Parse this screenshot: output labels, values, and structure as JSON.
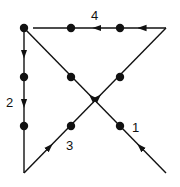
{
  "diagram": {
    "colors": {
      "stroke": "#111111",
      "background": "#ffffff"
    },
    "dots": [
      {
        "x": 24,
        "y": 28
      },
      {
        "x": 71,
        "y": 28
      },
      {
        "x": 120,
        "y": 28
      },
      {
        "x": 24,
        "y": 77
      },
      {
        "x": 71,
        "y": 77
      },
      {
        "x": 120,
        "y": 77
      },
      {
        "x": 24,
        "y": 126
      },
      {
        "x": 71,
        "y": 126
      },
      {
        "x": 120,
        "y": 126
      }
    ],
    "segments": [
      {
        "label": "1",
        "from": [
          166,
          173
        ],
        "to": [
          24,
          28
        ]
      },
      {
        "label": "2",
        "from": [
          24,
          28
        ],
        "to": [
          24,
          173
        ]
      },
      {
        "label": "3",
        "from": [
          24,
          173
        ],
        "to": [
          166,
          28
        ]
      },
      {
        "label": "4",
        "from": [
          166,
          28
        ],
        "to": [
          33,
          28
        ]
      }
    ],
    "labels": [
      {
        "text": "1",
        "x": 132,
        "y": 132
      },
      {
        "text": "2",
        "x": 6,
        "y": 107
      },
      {
        "text": "3",
        "x": 66,
        "y": 150
      },
      {
        "text": "4",
        "x": 91,
        "y": 20
      }
    ]
  }
}
